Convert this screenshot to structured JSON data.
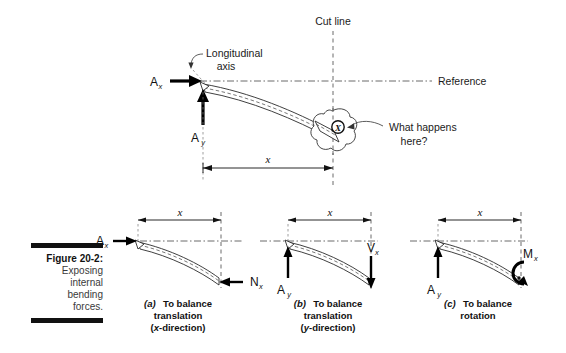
{
  "figure": {
    "caption_label": "Figure 20-2:",
    "caption_text_lines": [
      "Exposing",
      "internal",
      "bending",
      "forces."
    ]
  },
  "top_panel": {
    "cut_line_label": "Cut line",
    "reference_label": "Reference",
    "longitudinal_axis_label_line1": "Longitudinal",
    "longitudinal_axis_label_line2": "axis",
    "callout_line1": "What happens",
    "callout_line2": "here?",
    "cut_marker_symbol": "X",
    "force_ax_symbol": "A",
    "force_ax_subscript": "x",
    "force_ay_symbol": "A",
    "force_ay_subscript": "y",
    "dimension_label": "x"
  },
  "panels": [
    {
      "id": "a",
      "tag": "(a)",
      "caption_line1": "To balance",
      "caption_line2": "translation",
      "caption_line3_prefix": "(",
      "caption_line3_italic": "x",
      "caption_line3_suffix": "-direction)",
      "dimension_label": "x",
      "applied_symbol": "A",
      "applied_subscript": "x",
      "internal_symbol": "N",
      "internal_subscript": "x",
      "internal_kind": "arrow-left"
    },
    {
      "id": "b",
      "tag": "(b)",
      "caption_line1": "To balance",
      "caption_line2": "translation",
      "caption_line3_prefix": "(",
      "caption_line3_italic": "y",
      "caption_line3_suffix": "-direction)",
      "dimension_label": "x",
      "applied_symbol": "A",
      "applied_subscript": "y",
      "internal_symbol": "V",
      "internal_subscript": "x",
      "internal_kind": "arrow-down"
    },
    {
      "id": "c",
      "tag": "(c)",
      "caption_line1": "To balance",
      "caption_line2": "rotation",
      "caption_line3_prefix": "",
      "caption_line3_italic": "",
      "caption_line3_suffix": "",
      "dimension_label": "x",
      "applied_symbol": "A",
      "applied_subscript": "y",
      "internal_symbol": "M",
      "internal_subscript": "x",
      "internal_kind": "moment-curl"
    }
  ],
  "colors": {
    "ink": "#111111",
    "line": "#2a2a2a",
    "dashed": "#5a5a5a",
    "background": "#ffffff"
  }
}
